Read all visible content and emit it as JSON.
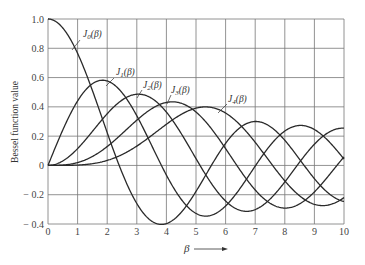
{
  "chart_data": {
    "type": "line",
    "title": "",
    "xlabel": "β →",
    "ylabel": "Bessel function value",
    "xlim": [
      0,
      10
    ],
    "ylim": [
      -0.4,
      1.0
    ],
    "grid": true,
    "legend": "inline curve labels",
    "x_ticks": [
      "0",
      "1",
      "2",
      "3",
      "4",
      "5",
      "6",
      "7",
      "8",
      "9",
      "10"
    ],
    "y_ticks": [
      "1.0",
      "0.8",
      "0.6",
      "0.4",
      "0.2",
      "0",
      "− 0.2",
      "− 0.4"
    ],
    "x": [
      0,
      1,
      2,
      3,
      4,
      5,
      6,
      7,
      8,
      9,
      10
    ],
    "series": [
      {
        "name": "J0(β)",
        "label_sub": "0",
        "values": [
          1.0,
          0.765,
          0.224,
          -0.26,
          -0.397,
          -0.178,
          0.151,
          0.3,
          0.172,
          -0.09,
          -0.246
        ]
      },
      {
        "name": "J1(β)",
        "label_sub": "1",
        "values": [
          0.0,
          0.44,
          0.577,
          0.339,
          -0.066,
          -0.328,
          -0.277,
          -0.005,
          0.235,
          0.245,
          0.043
        ]
      },
      {
        "name": "J2(β)",
        "label_sub": "2",
        "values": [
          0.0,
          0.115,
          0.353,
          0.486,
          0.364,
          0.047,
          -0.243,
          -0.301,
          -0.113,
          0.145,
          0.255
        ]
      },
      {
        "name": "J3(β)",
        "label_sub": "3",
        "values": [
          0.0,
          0.02,
          0.129,
          0.309,
          0.43,
          0.365,
          0.115,
          -0.168,
          -0.291,
          -0.181,
          0.058
        ]
      },
      {
        "name": "J4(β)",
        "label_sub": "4",
        "values": [
          0.0,
          0.002,
          0.034,
          0.132,
          0.281,
          0.391,
          0.358,
          0.158,
          -0.105,
          -0.265,
          -0.22
        ]
      }
    ]
  },
  "labels": {
    "ylabel": "Bessel function value",
    "xlabel": "β",
    "curve_prefix": "J",
    "curve_suffix": "(β)"
  }
}
